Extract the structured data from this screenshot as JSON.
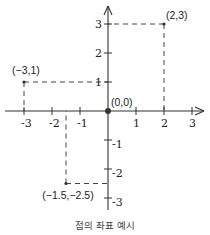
{
  "figure": {
    "caption": "점의 좌표 예시",
    "origin_px": [
      108,
      111
    ],
    "unit_px": [
      28,
      29
    ],
    "axis_color": "#333333",
    "dash_color": "#444444"
  },
  "chart_data": {
    "type": "scatter",
    "title": "",
    "caption": "점의 좌표 예시",
    "xlabel": "",
    "ylabel": "",
    "xlim": [
      -3.5,
      3.5
    ],
    "ylim": [
      -3.5,
      3.5
    ],
    "grid": false,
    "x_ticks": [
      -3,
      -2,
      -1,
      1,
      2,
      3
    ],
    "y_ticks": [
      -3,
      -2,
      -1,
      1,
      2,
      3
    ],
    "x_tick_labels": [
      "-3",
      "-2",
      "-1",
      "1",
      "2",
      "3"
    ],
    "y_tick_labels": [
      "-3",
      "-2",
      "-1",
      "1",
      "2",
      "3"
    ],
    "points": [
      {
        "x": 0,
        "y": 0,
        "label": "(0,0)"
      },
      {
        "x": 2,
        "y": 3,
        "label": "(2,3)"
      },
      {
        "x": -3,
        "y": 1,
        "label": "(-3,1)"
      },
      {
        "x": -1.5,
        "y": -2.5,
        "label": "(-1.5,-2.5)"
      }
    ],
    "annotations": [
      "dashed projection lines from each point to the x and y axes"
    ]
  }
}
